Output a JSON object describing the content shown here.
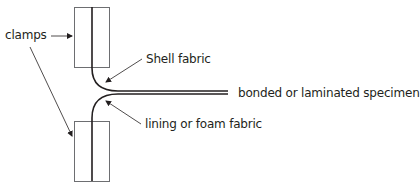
{
  "diagram": {
    "type": "peel-test-setup",
    "labels": {
      "clamps": "clamps",
      "shell": "Shell fabric",
      "specimen": "bonded or laminated specimen",
      "lining": "lining or foam fabric"
    },
    "colors": {
      "line": "#231f20",
      "clamp_stroke": "#6d6e71",
      "background": "#ffffff"
    }
  }
}
